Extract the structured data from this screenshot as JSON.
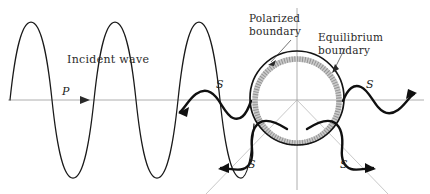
{
  "figure": {
    "title_visible": false,
    "background_color": "#ffffff",
    "width": 430,
    "height": 194
  },
  "labels": {
    "incident_wave": "Incident wave",
    "polarized_boundary_line1": "Polarized",
    "polarized_boundary_line2": "boundary",
    "equilibrium_boundary_line1": "Equilibrium",
    "equilibrium_boundary_line2": "boundary",
    "p_wave_symbol": "P",
    "s_back_symbol": "S",
    "s_forward_symbol": "S",
    "s_down_left_symbol": "S",
    "s_down_right_symbol": "S"
  },
  "colors": {
    "incident_wave_stroke": "#1a1a1a",
    "scattered_wave_stroke": "#101010",
    "polarized_circle_stroke": "#141414",
    "equilibrium_band_stroke": "#c9c9c9",
    "equilibrium_hatch_stroke": "#8f8f8f",
    "axis_stroke": "#9a9a9a",
    "guide_stroke": "#b0b0b0",
    "text_fill": "#2b2b2b"
  },
  "geometry": {
    "axis_y": 100,
    "axis_x_start": 8,
    "axis_x_end": 424,
    "vertical_axis_x": 297,
    "vertical_axis_top": 8,
    "vertical_axis_bottom": 190,
    "circle_center_x": 297,
    "circle_center_y": 98,
    "circle_radius": 47,
    "band_radius": 42,
    "incident_amplitude": 78,
    "incident_wavelength": 84,
    "incident_start_x": 10,
    "incident_end_x": 253,
    "guide_angle_deg": 47
  },
  "annotations": {
    "polarized_leader_from_x": 292,
    "polarized_leader_from_y": 40,
    "polarized_leader_to_x": 265,
    "polarized_leader_to_y": 65,
    "equilibrium_leader_from_x": 345,
    "equilibrium_leader_from_y": 48,
    "equilibrium_leader_to_x": 332,
    "equilibrium_leader_to_y": 72
  }
}
